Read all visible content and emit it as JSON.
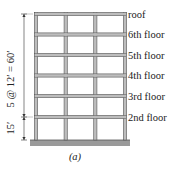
{
  "figure": {
    "floor_labels": [
      "roof",
      "6th floor",
      "5th floor",
      "4th floor",
      "3rd floor",
      "2nd floor"
    ],
    "bays": 3,
    "stories": 6,
    "dimension_upper": "5 @ 12′ = 60′",
    "dimension_lower": "15′",
    "caption": "(a)",
    "colors": {
      "frame_fill": "#bdbdbd",
      "frame_stroke": "#555555",
      "ground": "#9a9a9a"
    }
  }
}
